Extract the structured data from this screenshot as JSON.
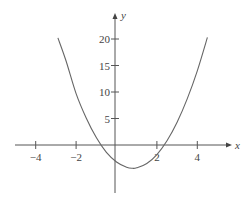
{
  "chart_data": {
    "type": "line",
    "title": "",
    "xlabel": "x",
    "ylabel": "y",
    "xlim": [
      -5,
      5.6
    ],
    "ylim": [
      -9,
      24
    ],
    "grid": false,
    "legend": null,
    "x_ticks": [
      -4,
      -2,
      2,
      4
    ],
    "x_tick_labels": [
      "−4",
      "−2",
      "2",
      "4"
    ],
    "y_ticks": [
      5,
      10,
      15,
      20
    ],
    "y_tick_labels": [
      "5",
      "10",
      "15",
      "20"
    ],
    "series": [
      {
        "name": "parabola",
        "x": [
          -2.9,
          -2.5,
          -2.0,
          -1.5,
          -1.0,
          -0.5,
          0.0,
          0.5,
          0.8,
          1.0,
          1.5,
          2.0,
          2.5,
          3.0,
          3.5,
          4.0,
          4.5
        ],
        "y": [
          20.2,
          15.9,
          9.7,
          5.1,
          1.4,
          -1.4,
          -3.2,
          -4.2,
          -4.4,
          -4.3,
          -3.5,
          -1.8,
          0.8,
          4.3,
          8.7,
          14.0,
          20.3
        ]
      }
    ],
    "annotations": []
  },
  "layout": {
    "origin_px": [
      115,
      145
    ],
    "x_px_per_unit": 20.2,
    "y_px_per_unit": 5.3,
    "x_tick_origin_px": 116.5,
    "x_axis_extent_px": [
      15,
      232
    ],
    "y_axis_extent_px": [
      13,
      193
    ]
  }
}
